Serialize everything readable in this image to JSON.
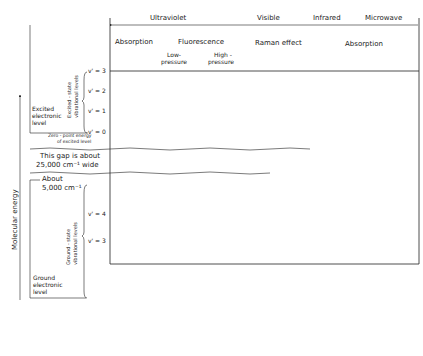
{
  "header": {
    "regions": [
      {
        "label": "Ultraviolet"
      },
      {
        "label": "Visible"
      },
      {
        "label": "Infrared"
      },
      {
        "label": "Microwave"
      }
    ],
    "processes": {
      "absorption_uv": "Absorption",
      "fluorescence": "Fluorescence",
      "raman": "Raman effect",
      "absorption_ir": "Absorption",
      "low_pressure": [
        "Low-",
        "pressure"
      ],
      "high_pressure": [
        "High -",
        "pressure"
      ]
    }
  },
  "axes": {
    "y_label": "Molecular energy",
    "x_label": "Wavelength"
  },
  "excited_state": {
    "level_label": [
      "Excited",
      "electronic",
      "level"
    ],
    "vib_label": [
      "Excited - state",
      "vibrational levels"
    ],
    "levels": [
      "v' = 3",
      "v' = 2",
      "v' = 1",
      "v' = 0"
    ],
    "zero_point": [
      "Zero - point energy",
      "of excited level"
    ]
  },
  "gap": {
    "text": [
      "This gap is about",
      "25,000 cm⁻¹ wide"
    ],
    "about": [
      "About",
      "5,000 cm⁻¹"
    ]
  },
  "ground_state": {
    "level_label": [
      "Ground",
      "electronic",
      "level"
    ],
    "vib_label": [
      "Ground - state",
      "vibrational levels"
    ],
    "levels": [
      "v' = 4",
      "v' = 3",
      "v' = 2",
      "v' = 1",
      "v' = 0"
    ],
    "zero_point": [
      "Zero - point energy",
      "of ground level"
    ]
  },
  "annotations": {
    "vib_lost": [
      "Vibrational",
      "energy lost",
      "by collisions"
    ],
    "note_box": [
      "The excited electronic",
      "state is not involved",
      "in infrared and",
      "microwave absorption."
    ],
    "fluor_freq": "Fluorescence-excitation frequency",
    "anti_stokes": "Anti - Stokes transition (ΔE +)",
    "raman_freq": "Raman - excitation frequency",
    "stokes": "Stokes transition (ΔE −)",
    "net_energy": [
      "Net energy",
      "change in",
      "molecule"
    ],
    "ir_vib_rot": [
      "Infrared vibration -",
      "rotation absorption"
    ],
    "ir_mw_pure": [
      "Infrared or",
      "microwave pure",
      "rotational",
      "absorption"
    ],
    "branches": "Branches",
    "rqp": [
      "R",
      "Q",
      "P"
    ],
    "j_ticks": [
      "0",
      "1",
      "2",
      "3",
      "4",
      "0"
    ],
    "rotation_omitted": "(Rotation transitions omitted above)",
    "rot_quantum": "Rotational quantum numbers, J"
  },
  "footer": {
    "electronic": "Electronic spectra",
    "vibrational": "Vibrational spectra",
    "rotational": "Rotational spectra"
  }
}
